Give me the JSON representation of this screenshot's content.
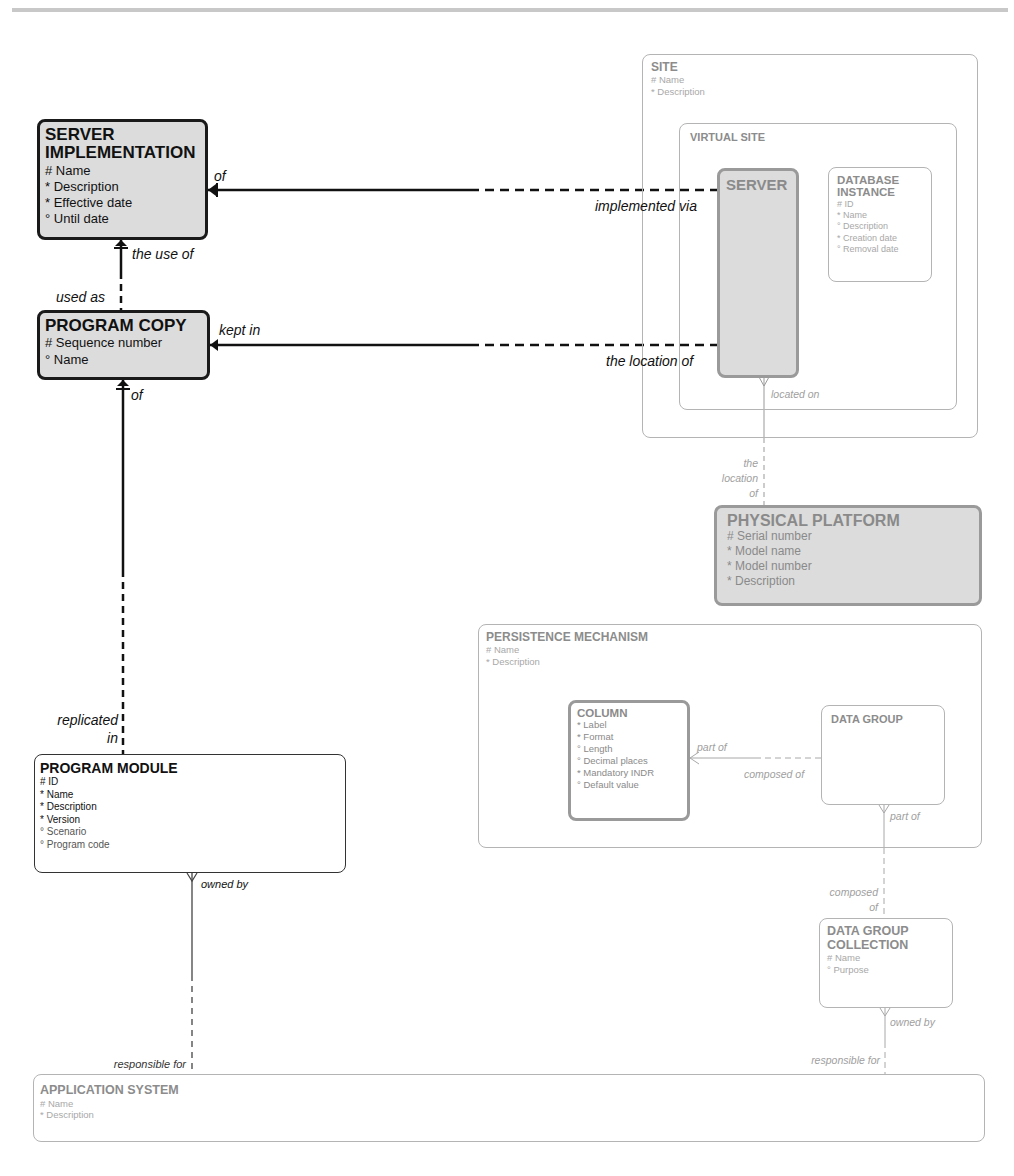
{
  "diagram": {
    "type": "entity-relationship",
    "entities": {
      "server_implementation": {
        "title": "SERVER\nIMPLEMENTATION",
        "attributes": [
          "# Name",
          "* Description",
          "* Effective date",
          "° Until date"
        ]
      },
      "program_copy": {
        "title": "PROGRAM COPY",
        "attributes": [
          "# Sequence number",
          "° Name"
        ]
      },
      "program_module": {
        "title": "PROGRAM MODULE",
        "attributes": [
          "# ID",
          "* Name",
          "* Description",
          "* Version",
          "° Scenario",
          "° Program code"
        ]
      },
      "site": {
        "title": "SITE",
        "attributes": [
          "# Name",
          "* Description"
        ]
      },
      "virtual_site": {
        "title": "VIRTUAL SITE",
        "attributes": []
      },
      "server": {
        "title": "SERVER",
        "attributes": []
      },
      "database_instance": {
        "title": "DATABASE\nINSTANCE",
        "attributes": [
          "# ID",
          "* Name",
          "° Description",
          "* Creation date",
          "° Removal date"
        ]
      },
      "physical_platform": {
        "title": "PHYSICAL PLATFORM",
        "attributes": [
          "# Serial number",
          "* Model name",
          "* Model number",
          "* Description"
        ]
      },
      "persistence_mechanism": {
        "title": "PERSISTENCE MECHANISM",
        "attributes": [
          "# Name",
          "* Description"
        ]
      },
      "column": {
        "title": "COLUMN",
        "attributes": [
          "* Label",
          "* Format",
          "° Length",
          "° Decimal places",
          "* Mandatory INDR",
          "° Default value"
        ]
      },
      "data_group": {
        "title": "DATA GROUP",
        "attributes": []
      },
      "data_group_collection": {
        "title": "DATA GROUP\nCOLLECTION",
        "attributes": [
          "# Name",
          "° Purpose"
        ]
      },
      "application_system": {
        "title": "APPLICATION SYSTEM",
        "attributes": [
          "# Name",
          "* Description"
        ]
      }
    },
    "relationship_labels": {
      "si_of": "of",
      "si_implemented_via": "implemented via",
      "si_the_use_of": "the use of",
      "pc_used_as": "used as",
      "pc_kept_in": "kept in",
      "pc_the_location_of": "the location of",
      "pc_of": "of",
      "pm_replicated_in": "replicated",
      "pm_replicated_in_2": "in",
      "pm_owned_by": "owned by",
      "as_responsible_for_pm": "responsible for",
      "server_located_on": "located on",
      "pp_the": "the",
      "pp_location": "location",
      "pp_of": "of",
      "col_part_of": "part of",
      "dg_composed_of": "composed of",
      "dg_part_of": "part of",
      "dgc_composed": "composed",
      "dgc_of": "of",
      "dgc_owned_by": "owned by",
      "as_responsible_for_dgc": "responsible for"
    }
  }
}
